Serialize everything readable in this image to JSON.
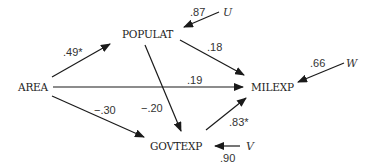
{
  "diagram": {
    "type": "path-diagram",
    "nodes": {
      "area": "AREA",
      "populat": "POPULAT",
      "milexp": "MILEXP",
      "govtexp": "GOVTEXP"
    },
    "error_terms": {
      "u": "U",
      "w": "W",
      "v": "V"
    },
    "coefficients": {
      "area_populat": ".49*",
      "populat_milexp": ".18",
      "area_milexp": ".19",
      "area_govtexp": "−.30",
      "populat_govtexp": "−.20",
      "govtexp_milexp": ".83*",
      "u_populat": ".87",
      "w_milexp": ".66",
      "v_govtexp": ".90"
    },
    "edges": [
      {
        "from": "AREA",
        "to": "POPULAT",
        "label": ".49*"
      },
      {
        "from": "POPULAT",
        "to": "MILEXP",
        "label": ".18"
      },
      {
        "from": "AREA",
        "to": "MILEXP",
        "label": ".19"
      },
      {
        "from": "AREA",
        "to": "GOVTEXP",
        "label": "−.30"
      },
      {
        "from": "POPULAT",
        "to": "GOVTEXP",
        "label": "−.20"
      },
      {
        "from": "GOVTEXP",
        "to": "MILEXP",
        "label": ".83*"
      },
      {
        "from": "U",
        "to": "POPULAT",
        "label": ".87"
      },
      {
        "from": "W",
        "to": "MILEXP",
        "label": ".66"
      },
      {
        "from": "V",
        "to": "GOVTEXP",
        "label": ".90"
      }
    ]
  }
}
